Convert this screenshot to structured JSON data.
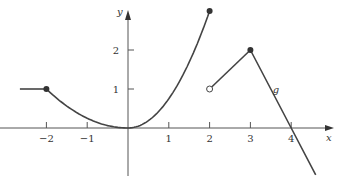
{
  "chart_data": {
    "type": "line",
    "title": "",
    "xlabel": "x",
    "ylabel": "y",
    "function_label": "g",
    "x_ticks": [
      -2,
      -1,
      1,
      2,
      3,
      4
    ],
    "x_tick_labels": [
      "−2",
      "−1",
      "1",
      "2",
      "3",
      "4"
    ],
    "y_ticks": [
      1,
      2
    ],
    "y_tick_labels": [
      "1",
      "2"
    ],
    "xlim": [
      -2.65,
      4.7
    ],
    "ylim": [
      -1.1,
      3.2
    ],
    "grid": false,
    "series": [
      {
        "name": "constant",
        "points": [
          [
            -2.65,
            1
          ],
          [
            -2,
            1
          ]
        ]
      },
      {
        "name": "parabola-left",
        "formula": "y = x^2/4",
        "points": [
          [
            -2,
            1
          ],
          [
            -1,
            0.25
          ],
          [
            0,
            0
          ]
        ]
      },
      {
        "name": "parabola-right",
        "formula": "y = 3x^2/4",
        "points": [
          [
            0,
            0
          ],
          [
            1,
            0.75
          ],
          [
            2,
            3
          ]
        ]
      },
      {
        "name": "line-up",
        "points": [
          [
            2,
            1
          ],
          [
            3,
            2
          ]
        ]
      },
      {
        "name": "line-down",
        "points": [
          [
            3,
            2
          ],
          [
            4,
            0
          ],
          [
            4.6,
            -1.2
          ]
        ]
      }
    ],
    "markers": [
      {
        "x": -2,
        "y": 1,
        "style": "filled"
      },
      {
        "x": 2,
        "y": 3,
        "style": "filled"
      },
      {
        "x": 2,
        "y": 1,
        "style": "open"
      },
      {
        "x": 3,
        "y": 2,
        "style": "filled"
      }
    ]
  }
}
